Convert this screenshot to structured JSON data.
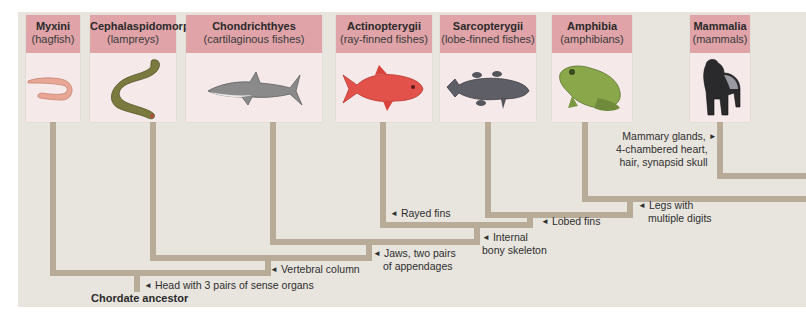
{
  "diagram": {
    "type": "cladogram",
    "root": {
      "label": "Chordate ancestor"
    },
    "taxa": [
      {
        "name": "Myxini",
        "common": "(hagfish)",
        "icon": "hagfish-icon"
      },
      {
        "name": "Cephalaspidomorphi",
        "common": "(lampreys)",
        "icon": "lamprey-icon"
      },
      {
        "name": "Chondrichthyes",
        "common": "(cartilaginous fishes)",
        "icon": "shark-icon"
      },
      {
        "name": "Actinopterygii",
        "common": "(ray-finned fishes)",
        "icon": "ray-finned-fish-icon"
      },
      {
        "name": "Sarcopterygii",
        "common": "(lobe-finned fishes)",
        "icon": "coelacanth-icon"
      },
      {
        "name": "Amphibia",
        "common": "(amphibians)",
        "icon": "frog-icon"
      },
      {
        "name": "Mammalia",
        "common": "(mammals)",
        "icon": "gorilla-icon"
      }
    ],
    "traits": [
      {
        "id": "head",
        "arrow": "◄",
        "lines": [
          "Head with 3 pairs of sense organs"
        ]
      },
      {
        "id": "vertebral",
        "arrow": "◄",
        "lines": [
          "Vertebral column"
        ]
      },
      {
        "id": "jaws",
        "arrow": "◄",
        "lines": [
          "Jaws, two pairs",
          "of appendages"
        ]
      },
      {
        "id": "bony",
        "arrow": "◄",
        "lines": [
          "Internal",
          "bony skeleton"
        ]
      },
      {
        "id": "rayed",
        "arrow": "◄",
        "lines": [
          "Rayed fins"
        ]
      },
      {
        "id": "lobed",
        "arrow": "◄",
        "lines": [
          "Lobed fins"
        ]
      },
      {
        "id": "legs",
        "arrow": "◄",
        "lines": [
          "Legs with",
          "multiple digits"
        ]
      },
      {
        "id": "mammal",
        "arrow": "►",
        "lines": [
          "Mammary glands,",
          "4-chambered heart,",
          "hair, synapsid skull"
        ]
      }
    ],
    "colors": {
      "panel": "#e8e5de",
      "card_header": "#dfa3a8",
      "card_body": "#f6e9ea",
      "branch": "#b8ac98"
    }
  }
}
